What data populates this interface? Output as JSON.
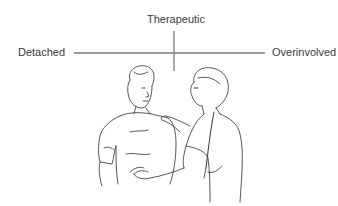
{
  "diagram": {
    "labels": {
      "top": "Therapeutic",
      "left": "Detached",
      "right": "Overinvolved"
    },
    "illustration": "Nurse placing a hand on a patient's shoulder and holding his hand",
    "colors": {
      "line": "#7a7a7a",
      "text": "#3a3a3a",
      "ink": "#444444",
      "background": "#ffffff"
    }
  }
}
